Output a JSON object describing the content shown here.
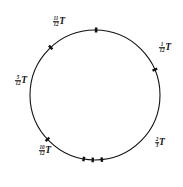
{
  "figure": {
    "type": "circle-diagram",
    "stroke_color": "#111111",
    "background_color": "#ffffff",
    "circle": {
      "center_x": 95,
      "center_y": 95,
      "radius": 65,
      "stroke_width": 1.1
    },
    "labels": [
      {
        "id": "label-11-oclock",
        "numerator": "11",
        "denominator": "12",
        "symbol": "T",
        "x": 59,
        "y": 22
      },
      {
        "id": "label-1-oclock",
        "numerator": "1",
        "denominator": "12",
        "symbol": "T",
        "x": 165,
        "y": 48
      },
      {
        "id": "label-9-oclock",
        "numerator": "5",
        "denominator": "12",
        "symbol": "T",
        "x": 21,
        "y": 81
      },
      {
        "id": "label-7-oclock",
        "numerator": "10",
        "denominator": "12",
        "symbol": "T",
        "x": 45,
        "y": 151
      },
      {
        "id": "label-4-oclock",
        "numerator": "2",
        "denominator": "3",
        "symbol": "T",
        "x": 160,
        "y": 143
      }
    ],
    "ticks": [
      {
        "id": "tick-top",
        "angle_deg": -89,
        "length": 5.0,
        "width": 2.6
      },
      {
        "id": "tick-upper-left",
        "angle_deg": -133,
        "length": 5.0,
        "width": 2.4
      },
      {
        "id": "tick-right",
        "angle_deg": -23,
        "length": 5.0,
        "width": 2.4
      },
      {
        "id": "tick-lower-left",
        "angle_deg": 137,
        "length": 5.0,
        "width": 2.4
      },
      {
        "id": "tick-bottom-left",
        "angle_deg": 100,
        "length": 4.6,
        "width": 2.4
      },
      {
        "id": "tick-bottom-mid",
        "angle_deg": 92,
        "length": 4.6,
        "width": 2.4
      },
      {
        "id": "tick-bottom-right",
        "angle_deg": 84,
        "length": 4.6,
        "width": 2.4
      }
    ]
  }
}
